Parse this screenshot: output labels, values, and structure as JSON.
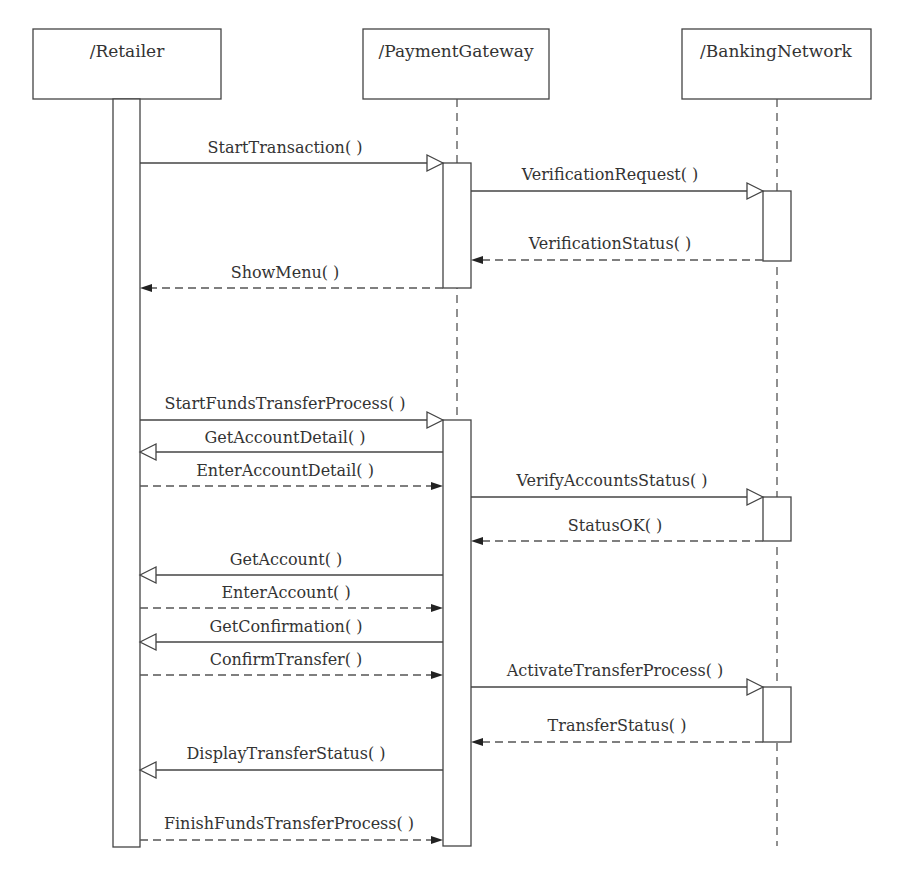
{
  "diagram": {
    "type": "UML sequence diagram",
    "participants": [
      {
        "name": "/Retailer"
      },
      {
        "name": "/PaymentGateway"
      },
      {
        "name": "/BankingNetwork"
      }
    ],
    "messages": [
      {
        "label": "StartTransaction( )",
        "from": "/Retailer",
        "to": "/PaymentGateway",
        "kind": "call"
      },
      {
        "label": "VerificationRequest( )",
        "from": "/PaymentGateway",
        "to": "/BankingNetwork",
        "kind": "call"
      },
      {
        "label": "VerificationStatus( )",
        "from": "/BankingNetwork",
        "to": "/PaymentGateway",
        "kind": "return"
      },
      {
        "label": "ShowMenu( )",
        "from": "/PaymentGateway",
        "to": "/Retailer",
        "kind": "return"
      },
      {
        "label": "StartFundsTransferProcess( )",
        "from": "/Retailer",
        "to": "/PaymentGateway",
        "kind": "call"
      },
      {
        "label": "GetAccountDetail( )",
        "from": "/PaymentGateway",
        "to": "/Retailer",
        "kind": "call"
      },
      {
        "label": "EnterAccountDetail( )",
        "from": "/Retailer",
        "to": "/PaymentGateway",
        "kind": "return"
      },
      {
        "label": "VerifyAccountsStatus( )",
        "from": "/PaymentGateway",
        "to": "/BankingNetwork",
        "kind": "call"
      },
      {
        "label": "StatusOK( )",
        "from": "/BankingNetwork",
        "to": "/PaymentGateway",
        "kind": "return"
      },
      {
        "label": "GetAccount( )",
        "from": "/PaymentGateway",
        "to": "/Retailer",
        "kind": "call"
      },
      {
        "label": "EnterAccount( )",
        "from": "/Retailer",
        "to": "/PaymentGateway",
        "kind": "return"
      },
      {
        "label": "GetConfirmation( )",
        "from": "/PaymentGateway",
        "to": "/Retailer",
        "kind": "call"
      },
      {
        "label": "ConfirmTransfer( )",
        "from": "/Retailer",
        "to": "/PaymentGateway",
        "kind": "return"
      },
      {
        "label": "ActivateTransferProcess( )",
        "from": "/PaymentGateway",
        "to": "/BankingNetwork",
        "kind": "call"
      },
      {
        "label": "TransferStatus( )",
        "from": "/BankingNetwork",
        "to": "/PaymentGateway",
        "kind": "return"
      },
      {
        "label": "DisplayTransferStatus( )",
        "from": "/PaymentGateway",
        "to": "/Retailer",
        "kind": "call"
      },
      {
        "label": "FinishFundsTransferProcess( )",
        "from": "/Retailer",
        "to": "/PaymentGateway",
        "kind": "return"
      }
    ]
  }
}
